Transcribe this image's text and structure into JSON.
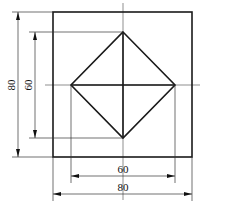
{
  "drawing": {
    "type": "technical-drawing",
    "description": "Square plate with inscribed diamond (square rotated 45°) and center lines",
    "outer_square": {
      "size_label": "80"
    },
    "inner_diamond": {
      "size_label": "60"
    },
    "dimensions": {
      "vertical_outer": "80",
      "vertical_inner": "60",
      "horizontal_inner": "60",
      "horizontal_outer": "80"
    },
    "colors": {
      "line": "#1a1a1a",
      "background": "#ffffff"
    }
  }
}
